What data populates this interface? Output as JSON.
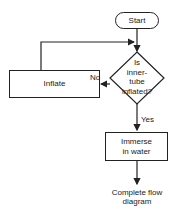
{
  "flowchart": {
    "start": {
      "label": "Start"
    },
    "decision": {
      "lines": [
        "Is",
        "inner-",
        "tube",
        "inflated?"
      ]
    },
    "inflate": {
      "label": "Inflate"
    },
    "immerse": {
      "lines": [
        "Immerse",
        "in water"
      ]
    },
    "end": {
      "lines": [
        "Complete flow",
        "diagram"
      ]
    },
    "edges": {
      "no_label": "No",
      "yes_label": "Yes"
    }
  },
  "colors": {
    "stroke": "#222222",
    "background": "#ffffff"
  }
}
